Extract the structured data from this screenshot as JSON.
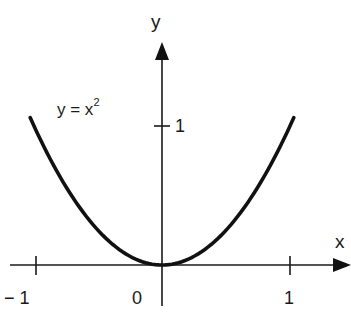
{
  "chart_data": {
    "type": "line",
    "title": "",
    "xlabel": "x",
    "ylabel": "y",
    "xlim": [
      -1.25,
      1.47
    ],
    "ylim": [
      -0.3,
      1.6
    ],
    "grid": false,
    "legend": null,
    "x_ticks": [
      -1,
      0,
      1
    ],
    "x_tick_labels": [
      "− 1",
      "0",
      "1"
    ],
    "y_ticks": [
      1
    ],
    "y_tick_labels": [
      "1"
    ],
    "series": [
      {
        "name": "y = x^2",
        "function": "y = x^2",
        "x": [
          -1.03,
          -0.75,
          -0.5,
          -0.25,
          0,
          0.25,
          0.5,
          0.75,
          1.03
        ],
        "values": [
          1.06,
          0.5625,
          0.25,
          0.0625,
          0,
          0.0625,
          0.25,
          0.5625,
          1.06
        ],
        "color": "#111111"
      }
    ],
    "annotations": [
      {
        "text": "y = x²",
        "x": -0.65,
        "y": 1.15
      }
    ]
  },
  "labels": {
    "x_axis": "x",
    "y_axis": "y",
    "curve_base": "y = x",
    "curve_exp": "2",
    "tick_neg1": "− 1",
    "tick_0": "0",
    "tick_pos1": "1",
    "tick_y1": "1"
  },
  "colors": {
    "curve": "#111111",
    "axes": "#1a1a1a",
    "background": "#ffffff"
  }
}
